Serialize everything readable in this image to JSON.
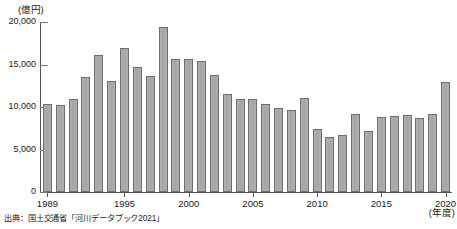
{
  "chart_data": {
    "type": "bar",
    "title": "",
    "subtitle": "",
    "xlabel": "(年度)",
    "ylabel": "(億円)",
    "ylim": [
      0,
      20000
    ],
    "yticks": [
      0,
      5000,
      10000,
      15000,
      20000
    ],
    "ytick_labels": [
      "0",
      "5,000",
      "10,000",
      "15,000",
      "20,000"
    ],
    "xticks": [
      1989,
      1995,
      2000,
      2005,
      2010,
      2015,
      2020
    ],
    "xtick_labels": [
      "1989",
      "1995",
      "2000",
      "2005",
      "2010",
      "2015",
      "2020"
    ],
    "grid": false,
    "legend": null,
    "categories": [
      "1989",
      "1990",
      "1991",
      "1992",
      "1993",
      "1994",
      "1995",
      "1996",
      "1997",
      "1998",
      "1999",
      "2000",
      "2001",
      "2002",
      "2003",
      "2004",
      "2005",
      "2006",
      "2007",
      "2008",
      "2009",
      "2010",
      "2011",
      "2012",
      "2013",
      "2014",
      "2015",
      "2016",
      "2017",
      "2018",
      "2019",
      "2020"
    ],
    "values": [
      10300,
      10250,
      10900,
      13500,
      16100,
      13100,
      16900,
      14700,
      13700,
      19400,
      15600,
      15700,
      15400,
      13800,
      11500,
      10900,
      11000,
      10300,
      9900,
      9700,
      11100,
      7400,
      6500,
      6700,
      9200,
      7200,
      8800,
      9000,
      9100,
      8700,
      9200,
      12900
    ],
    "last_value_label": "14,500",
    "series_name": "河川事業費"
  },
  "footer": {
    "source": "出典：国土交通省「河川データブック2021」"
  },
  "colors": {
    "bar_fill": "#a9a9a9",
    "bar_border": "#6e6e6e",
    "axis": "#555555",
    "text": "#1a1a1a",
    "background": "#ffffff"
  }
}
